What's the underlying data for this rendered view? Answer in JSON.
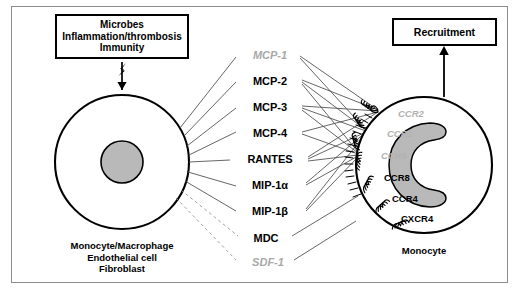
{
  "figure": {
    "title_box": {
      "lines": [
        "Microbes",
        "Inflammation/thrombosis",
        "Immunity"
      ],
      "text": "Microbes\nInflammation/thrombosis\nImmunity"
    },
    "outcome_box": {
      "label": "Recruitment"
    },
    "source_cell": {
      "caption_lines": [
        "Monocyte/Macrophage",
        "Endothelial cell",
        "Fibroblast"
      ],
      "caption": "Monocyte/Macrophage\nEndothelial cell\nFibroblast"
    },
    "target_cell": {
      "caption": "Monocyte"
    },
    "stimulus_arrow": {
      "name": "lightning-arrow"
    },
    "chemokines": [
      {
        "label": "MCP-1",
        "style": "muted",
        "y": 55
      },
      {
        "label": "MCP-2",
        "style": "primary",
        "y": 81
      },
      {
        "label": "MCP-3",
        "style": "primary",
        "y": 107
      },
      {
        "label": "MCP-4",
        "style": "primary",
        "y": 133
      },
      {
        "label": "RANTES",
        "style": "primary",
        "y": 159
      },
      {
        "label": "MIP-1α",
        "style": "primary",
        "y": 185
      },
      {
        "label": "MIP-1β",
        "style": "primary",
        "y": 211
      },
      {
        "label": "MDC",
        "style": "primary",
        "y": 238
      },
      {
        "label": "SDF-1",
        "style": "muted",
        "y": 262
      }
    ],
    "receptors": [
      {
        "label": "CCR2",
        "style": "muted",
        "x": 398,
        "y": 113
      },
      {
        "label": "CCR1",
        "style": "muted",
        "x": 387,
        "y": 133
      },
      {
        "label": "CCR5",
        "style": "muted",
        "x": 381,
        "y": 155
      },
      {
        "label": "CCR8",
        "style": "primary",
        "x": 384,
        "y": 177
      },
      {
        "label": "CCR4",
        "style": "primary",
        "x": 392,
        "y": 198
      },
      {
        "label": "CXCR4",
        "style": "primary",
        "x": 401,
        "y": 218
      }
    ],
    "colors": {
      "ink": "#000000",
      "muted_label": "#a8a8a8",
      "nucleus_fill": "#b9b9b9",
      "frame": "#8d8d8d",
      "connector": "#4a4a4a"
    }
  }
}
